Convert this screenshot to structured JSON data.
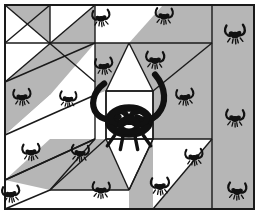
{
  "artwork": {
    "title": "Pinwheel Star Quilt Block with Insect Motifs",
    "width": 259,
    "height": 214,
    "background_color": "#ffffff",
    "palette": {
      "light_patch": "#ffffff",
      "dark_patch": "#b6b6b6",
      "seam_line": "#1a1a1a",
      "ink": "#111111",
      "outer_margin": "#ffffff"
    },
    "frame": {
      "margin_left": 4,
      "margin_top": 4,
      "margin_right": 5,
      "margin_bottom": 5,
      "stroke_width": 2
    }
  },
  "layout": {
    "block": {
      "x": 5,
      "y": 5,
      "width": 207,
      "height": 204
    },
    "side_band": {
      "x": 212,
      "y": 5,
      "width": 42,
      "height": 204,
      "fill": "dark_patch"
    },
    "center_square": {
      "x": 106,
      "y": 91,
      "width": 47,
      "height": 48,
      "fill": "light_patch"
    },
    "pinwheel_hub": {
      "x": 50,
      "y": 43
    }
  },
  "patches": [
    {
      "name": "top-left-pinwheel-vane-a",
      "points": "5,5 50,5 50,43",
      "fill": "#b6b6b6"
    },
    {
      "name": "top-left-pinwheel-vane-b",
      "points": "5,5 50,43 5,43",
      "fill": "#ffffff"
    },
    {
      "name": "top-left-pinwheel-vane-c",
      "points": "50,5 95,5 50,43",
      "fill": "#ffffff"
    },
    {
      "name": "top-left-pinwheel-vane-d",
      "points": "95,5 95,43 50,43",
      "fill": "#b6b6b6"
    },
    {
      "name": "top-left-pinwheel-vane-e",
      "points": "5,43 50,43 5,82",
      "fill": "#ffffff"
    },
    {
      "name": "top-left-pinwheel-vane-f",
      "points": "50,43 50,82 5,82",
      "fill": "#b6b6b6"
    },
    {
      "name": "top-center-triangle-left",
      "points": "95,5 129,43 95,43",
      "fill": "#ffffff"
    },
    {
      "name": "top-center-triangle-right",
      "points": "95,5 163,5 129,43",
      "fill": "#ffffff"
    },
    {
      "name": "top-band-dark-wedge",
      "points": "163,5 212,5 212,43 129,43",
      "fill": "#b6b6b6"
    },
    {
      "name": "upper-left-diagonal-band",
      "points": "5,82 50,43 95,43 50,95 5,135",
      "fill": "#b6b6b6"
    },
    {
      "name": "left-white-wedge-upper",
      "points": "5,43 5,82 50,43",
      "fill": "#ffffff"
    },
    {
      "name": "left-white-wedge-lower",
      "points": "5,135 50,95 95,95 50,139 5,180",
      "fill": "#ffffff"
    },
    {
      "name": "star-point-top",
      "points": "106,91 129,43 153,91",
      "fill": "#ffffff"
    },
    {
      "name": "star-field-top-left",
      "points": "95,43 129,43 106,91 95,95",
      "fill": "#b6b6b6"
    },
    {
      "name": "star-field-top-right",
      "points": "129,43 212,43 153,91",
      "fill": "#b6b6b6"
    },
    {
      "name": "star-field-left",
      "points": "95,95 106,91 106,139 95,139",
      "fill": "#ffffff"
    },
    {
      "name": "star-field-right",
      "points": "153,91 212,43 212,139 153,139",
      "fill": "#b6b6b6"
    },
    {
      "name": "lower-left-diagonal-band",
      "points": "5,180 50,139 95,139 50,190 5,209",
      "fill": "#b6b6b6"
    },
    {
      "name": "bottom-left-white",
      "points": "5,180 5,209 50,190",
      "fill": "#ffffff"
    },
    {
      "name": "star-point-bottom",
      "points": "106,139 129,190 153,139",
      "fill": "#ffffff"
    },
    {
      "name": "bottom-center-white-wedge",
      "points": "50,190 95,139 106,139 129,190",
      "fill": "#b6b6b6"
    },
    {
      "name": "bottom-right-white-wedge",
      "points": "129,190 153,139 212,139 212,209 129,209",
      "fill": "#b6b6b6"
    },
    {
      "name": "bottom-white-triangle-mid",
      "points": "50,190 129,190 129,209 50,209",
      "fill": "#ffffff"
    },
    {
      "name": "bottom-right-light-triangle",
      "points": "153,139 212,139 153,209",
      "fill": "#ffffff"
    }
  ],
  "seams": [
    "5,43 212,43",
    "5,5 212,5",
    "5,209 212,209",
    "5,5 5,209",
    "212,5 212,209",
    "254,5 254,209",
    "5,5 95,82",
    "95,5 5,82",
    "50,5 50,43",
    "95,5 95,43",
    "5,43 50,5",
    "5,82 95,43",
    "5,135 95,95",
    "5,180 95,139",
    "5,135 5,180",
    "95,43 95,95",
    "95,95 95,139",
    "95,139 5,180",
    "50,190 95,139",
    "50,190 129,190",
    "129,190 153,139",
    "106,91 129,43",
    "129,43 153,91",
    "106,91 153,91",
    "106,139 153,139",
    "106,91 106,139",
    "153,91 153,139",
    "153,91 212,43",
    "153,139 212,139",
    "106,139 50,190",
    "106,139 129,190",
    "129,190 153,139",
    "212,139 153,209",
    "5,209 50,190"
  ],
  "motifs": {
    "center_large_insect": {
      "name": "knotted-insect-medallion",
      "x": 129,
      "y": 113,
      "scale": 3.1,
      "description": "large insect with long curving antennae and a knotted tangled body"
    },
    "small_insects": [
      {
        "x": 101,
        "y": 18,
        "scale": 1.0,
        "rot": -4
      },
      {
        "x": 164,
        "y": 16,
        "scale": 1.0,
        "rot": 3
      },
      {
        "x": 235,
        "y": 34,
        "scale": 1.15,
        "rot": -2
      },
      {
        "x": 104,
        "y": 66,
        "scale": 1.0,
        "rot": -6
      },
      {
        "x": 155,
        "y": 60,
        "scale": 1.05,
        "rot": 2
      },
      {
        "x": 22,
        "y": 97,
        "scale": 1.0,
        "rot": -3
      },
      {
        "x": 68,
        "y": 99,
        "scale": 0.95,
        "rot": 4
      },
      {
        "x": 185,
        "y": 97,
        "scale": 1.0,
        "rot": -5
      },
      {
        "x": 235,
        "y": 118,
        "scale": 1.05,
        "rot": 2
      },
      {
        "x": 31,
        "y": 152,
        "scale": 1.0,
        "rot": -2
      },
      {
        "x": 80,
        "y": 153,
        "scale": 1.0,
        "rot": 5
      },
      {
        "x": 194,
        "y": 157,
        "scale": 1.0,
        "rot": -3
      },
      {
        "x": 11,
        "y": 194,
        "scale": 1.0,
        "rot": -6
      },
      {
        "x": 101,
        "y": 190,
        "scale": 1.0,
        "rot": 3
      },
      {
        "x": 160,
        "y": 186,
        "scale": 1.05,
        "rot": -2
      },
      {
        "x": 237,
        "y": 191,
        "scale": 1.05,
        "rot": 4
      }
    ]
  }
}
